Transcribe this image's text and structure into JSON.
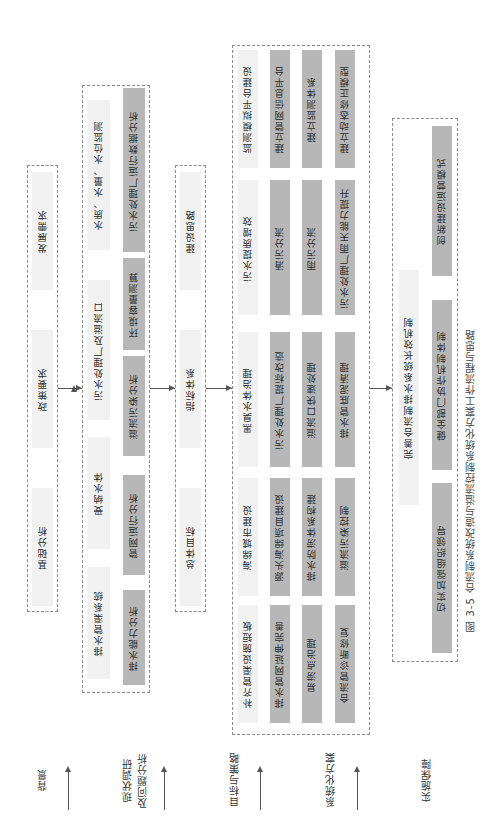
{
  "figure": {
    "caption": "图 3-5  合流制系统改造与溢流控制系统化方案工作流程与思路",
    "orientation": "rotated 90° counterclockwise"
  },
  "stages": [
    {
      "label": "背景"
    },
    {
      "label": "现状调研\n及问题分析",
      "line1": "现状调研",
      "line2": "及问题分析"
    },
    {
      "label": "目标与策略"
    },
    {
      "label": "系统化方案"
    },
    {
      "label": "实施保障"
    }
  ],
  "background": {
    "items": [
      "基础分析",
      "政策要求",
      "发展需求"
    ]
  },
  "survey": {
    "categories": [
      "排水管渠系统",
      "受纳水体",
      "污水处理厂及溢流口",
      "水质、水量、水位监测"
    ],
    "analyses": [
      "排水能力分析",
      "管网运行分析",
      "溢流污染分析",
      "环境容量测算",
      "污水处理厂运行数据分析"
    ]
  },
  "goals": {
    "items": [
      "总体目标",
      "指标体系",
      "建设思路"
    ]
  },
  "solution": {
    "columns": [
      {
        "title": "补齐管渠设施短板",
        "items": [
          "排水管网延伸完善",
          "易涝点治理",
          "合流管诊断修复"
        ]
      },
      {
        "title": "海绵城市建设",
        "items": [
          "源头海绵项目建设",
          "排水防涝体系构建",
          "溢流污染控制"
        ]
      },
      {
        "title": "黑臭水体治理",
        "items": [
          "污水处理厂提标改造",
          "溢流口快速处理",
          "排水管底泥清理"
        ]
      },
      {
        "title": "污水提质增效",
        "items": [
          "清污分流",
          "雨污分流",
          "污水处理厂雨天能力提升"
        ]
      },
      {
        "title": "监测模拟平台建设",
        "items": [
          "建立管网信息平台",
          "建立监测体系",
          "建立动态修正模型"
        ]
      }
    ]
  },
  "implementation": {
    "title": "完善合流制排水系统长效机制",
    "items": [
      "切实加强组织领导",
      "健全部门协作机制体制",
      "创新建设运营模式"
    ]
  },
  "colors": {
    "light_cell": "#f1f1f1",
    "dark_cell": "#b7b7b7",
    "dashed_border": "#8a8a8a",
    "arrow": "#555555"
  }
}
